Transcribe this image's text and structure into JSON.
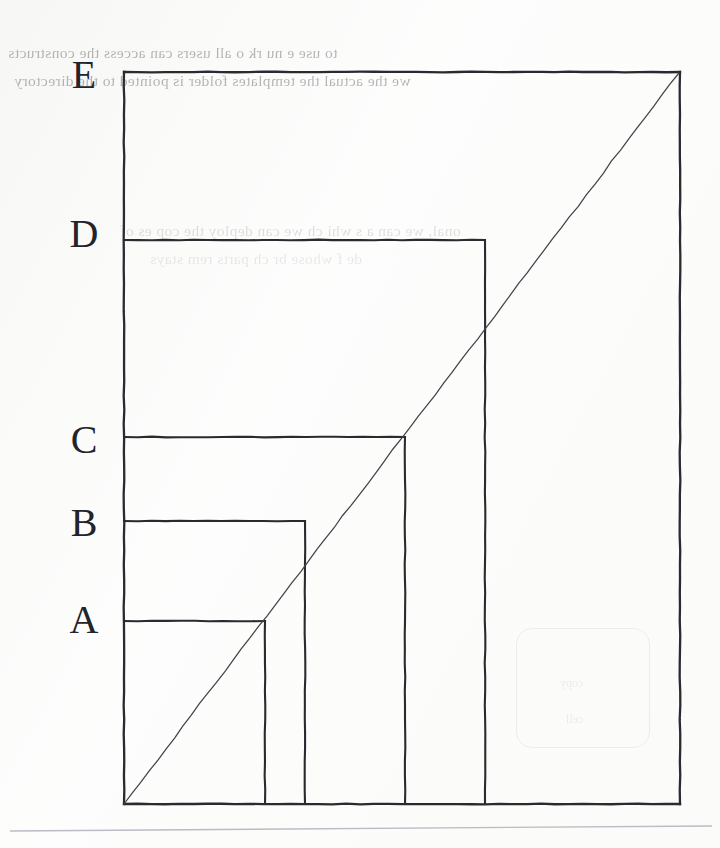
{
  "figure": {
    "stroke_color": "#2a2a30",
    "diagonal_color": "#42424c",
    "background_color": "#fdfdfd",
    "origin": {
      "x": 124,
      "y": 804
    },
    "labels": [
      {
        "text": "A",
        "x": 84,
        "y": 624
      },
      {
        "text": "B",
        "x": 84,
        "y": 527
      },
      {
        "text": "C",
        "x": 84,
        "y": 444
      },
      {
        "text": "D",
        "x": 84,
        "y": 238
      },
      {
        "text": "E",
        "x": 84,
        "y": 79
      }
    ],
    "rectangles": [
      {
        "name": "A",
        "x": 124,
        "y": 621,
        "width": 141,
        "height": 183,
        "right": 265,
        "top": 621
      },
      {
        "name": "B",
        "x": 124,
        "y": 521,
        "width": 181,
        "height": 283,
        "right": 305,
        "top": 521
      },
      {
        "name": "C",
        "x": 124,
        "y": 437,
        "width": 281,
        "height": 367,
        "right": 405,
        "top": 437
      },
      {
        "name": "D",
        "x": 124,
        "y": 240,
        "width": 361,
        "height": 564,
        "right": 485,
        "top": 240
      },
      {
        "name": "E",
        "x": 124,
        "y": 72,
        "width": 556,
        "height": 732,
        "right": 680,
        "top": 72
      }
    ],
    "diagonal": {
      "x1": 124,
      "y1": 804,
      "x2": 679,
      "y2": 73
    },
    "baseline_rule": {
      "x1": 10,
      "y1": 831,
      "x2": 712,
      "y2": 826
    }
  },
  "bleed_through_text": {
    "line_1": "to use  e nu    rk  o all users can access the constructs",
    "line_2": "we the actual the templates folder is pointed to the directory",
    "line_3": "onal, we can a s  whi ch we can deploy the  cop  es of",
    "line_4": "de  f  whose  br  ch  parts  rem  stays",
    "ghost_1": "copy",
    "ghost_2": "cell"
  },
  "chart_data": {
    "type": "diagram",
    "categories": [
      "A",
      "B",
      "C",
      "D",
      "E"
    ],
    "widths": [
      141,
      181,
      281,
      361,
      556
    ],
    "heights": [
      183,
      283,
      367,
      564,
      732
    ],
    "aspect_ratio_note": "All top-right corners are collinear with the origin along the diagonal.",
    "xlabel": "",
    "ylabel": "",
    "grid": false,
    "legend": "none"
  }
}
